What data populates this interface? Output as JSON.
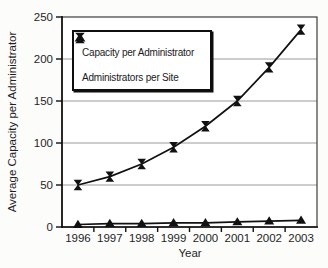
{
  "figure": {
    "background": "#fcfcfb"
  },
  "chart_data": {
    "type": "line",
    "categories": [
      "1996",
      "1997",
      "1998",
      "1999",
      "2000",
      "2001",
      "2002",
      "2003"
    ],
    "series": [
      {
        "name": "Capacity per Administrator",
        "marker": "hourglass",
        "values": [
          50,
          60,
          75,
          95,
          120,
          150,
          190,
          235
        ]
      },
      {
        "name": "Administrators per Site",
        "marker": "triangle",
        "values": [
          3,
          4,
          4,
          5,
          5,
          6,
          7,
          8
        ]
      }
    ],
    "title": "",
    "xlabel": "Year",
    "ylabel": "Average Capacity per Administrator",
    "ylim": [
      0,
      250
    ],
    "y_ticks": [
      0,
      50,
      100,
      150,
      200,
      250
    ],
    "grid": true,
    "legend_position": "upper-left",
    "colors": {
      "line": "#111111",
      "marker": "#111111",
      "grid": "#9a9a9a",
      "frame": "#3c3c3c",
      "axis": "#111111",
      "text": "#1f1f1f",
      "legend_border": "#0e0e0e",
      "background": "#ffffff"
    }
  },
  "legend": {
    "items": [
      {
        "label": "Capacity per Administrator",
        "marker": "hourglass-marker-icon"
      },
      {
        "label": "Administrators per Site",
        "marker": "triangle-marker-icon"
      }
    ]
  }
}
